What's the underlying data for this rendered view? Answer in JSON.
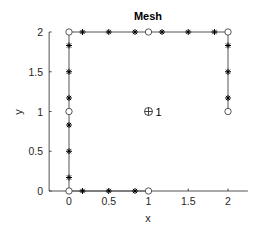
{
  "chart_data": {
    "type": "scatter",
    "title": "Mesh",
    "xlabel": "x",
    "ylabel": "y",
    "xlim": [
      -0.25,
      2.25
    ],
    "ylim": [
      0,
      2
    ],
    "xticks": [
      0,
      0.5,
      1,
      1.5,
      2
    ],
    "xtick_labels": [
      "0",
      "0.5",
      "1",
      "1.5",
      "2"
    ],
    "yticks": [
      0,
      0.5,
      1,
      1.5,
      2
    ],
    "ytick_labels": [
      "0",
      "0.5",
      "1",
      "1.5",
      "2"
    ],
    "grid": false,
    "box": false,
    "boundary_path": [
      [
        2,
        1
      ],
      [
        2,
        2
      ],
      [
        0,
        2
      ],
      [
        0,
        0
      ],
      [
        1,
        0
      ]
    ],
    "series": [
      {
        "name": "vertices",
        "marker": "circle",
        "points": [
          [
            0,
            0
          ],
          [
            1,
            0
          ],
          [
            0,
            1
          ],
          [
            0,
            2
          ],
          [
            1,
            2
          ],
          [
            2,
            2
          ],
          [
            2,
            1
          ]
        ]
      },
      {
        "name": "edge-nodes",
        "marker": "asterisk",
        "points": [
          [
            0.17,
            0
          ],
          [
            0.5,
            0
          ],
          [
            0.83,
            0
          ],
          [
            0,
            0.17
          ],
          [
            0,
            0.5
          ],
          [
            0,
            0.83
          ],
          [
            0,
            1.17
          ],
          [
            0,
            1.5
          ],
          [
            0,
            1.83
          ],
          [
            0.17,
            2
          ],
          [
            0.5,
            2
          ],
          [
            0.83,
            2
          ],
          [
            1.17,
            2
          ],
          [
            1.5,
            2
          ],
          [
            1.83,
            2
          ],
          [
            2,
            1.17
          ],
          [
            2,
            1.5
          ],
          [
            2,
            1.83
          ]
        ]
      },
      {
        "name": "element-centers",
        "marker": "circle-plus",
        "points": [
          [
            1,
            1
          ]
        ],
        "labels": [
          "1"
        ]
      }
    ],
    "colors": {
      "line": "#555555",
      "marker": "#000000",
      "axis": "#262626"
    }
  }
}
